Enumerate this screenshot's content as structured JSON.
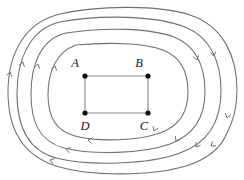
{
  "figure": {
    "kind": "field-line-diagram",
    "background_color": "#ffffff",
    "width": 244,
    "height": 180,
    "colors": {
      "field_line": "#6f6f73",
      "arrow": "#6f6f73",
      "circuit_wire": "#8a8a8f",
      "node_dot": "#111114",
      "label_text": "#16161a"
    }
  },
  "circuit": {
    "shape": "rectangle",
    "vertices": [
      {
        "id": "A",
        "label": "A",
        "x": 85,
        "y": 76,
        "label_x": 79,
        "label_y": 67,
        "label_anchor": "end"
      },
      {
        "id": "B",
        "label": "B",
        "x": 148,
        "y": 76,
        "label_x": 143,
        "label_y": 67,
        "label_anchor": "end"
      },
      {
        "id": "C",
        "label": "C",
        "x": 148,
        "y": 113,
        "label_x": 144,
        "label_y": 130,
        "label_anchor": "middle"
      },
      {
        "id": "D",
        "label": "D",
        "x": 85,
        "y": 113,
        "label_x": 85,
        "label_y": 130,
        "label_anchor": "middle"
      }
    ],
    "edges": [
      {
        "from": "A",
        "to": "B"
      },
      {
        "from": "B",
        "to": "C"
      },
      {
        "from": "C",
        "to": "D"
      },
      {
        "from": "D",
        "to": "A"
      }
    ],
    "node_dot_radius": 2.6
  },
  "field_lines": {
    "count": 4,
    "direction": "counterclockwise",
    "description": "nested closed rounded-rectangular loops encircling the circuit",
    "loops": [
      {
        "id": "loop-1-innermost",
        "closed": false,
        "path": "M 76 45 C 110 42 145 43 163 50 C 181 57 188 72 188 92 C 188 112 180 126 160 133 C 138 141 98 142 75 136 C 55 131 48 116 48 95 C 48 72 56 52 76 45",
        "open_end": {
          "x": 76,
          "y": 45
        }
      },
      {
        "id": "loop-2",
        "closed": true,
        "path": "M 66 33 C 104 27 150 28 174 37 C 196 46 205 66 205 92 C 205 118 194 135 170 144 C 142 154 92 155 64 148 C 38 141 31 120 31 94 C 31 66 40 39 66 33 Z"
      },
      {
        "id": "loop-3",
        "closed": true,
        "path": "M 60 22 C 102 14 157 16 185 27 C 210 37 221 61 221 91 C 221 122 208 143 180 153 C 148 165 88 166 56 158 C 26 150 17 124 17 93 C 17 61 29 29 60 22 Z"
      },
      {
        "id": "loop-4-outermost",
        "closed": false,
        "path": "M 227 133 C 235 118 237 104 237 90 C 237 56 223 26 190 15 C 156 4 96 6 60 14 C 26 22 8 52 8 92 C 8 128 22 155 56 166 C 92 177 152 176 186 166 C 208 159 221 148 227 133",
        "open_end": {
          "x": 227,
          "y": 133
        }
      }
    ],
    "arrows": [
      {
        "on": "loop-1-innermost",
        "x": 55,
        "y": 66,
        "angle": -76,
        "points": "up-left"
      },
      {
        "on": "loop-1-innermost",
        "x": 154,
        "y": 131,
        "angle": 112,
        "points": "down-right"
      },
      {
        "on": "loop-1-innermost",
        "x": 88,
        "y": 140,
        "angle": 190,
        "points": "left"
      },
      {
        "on": "loop-2",
        "x": 38,
        "y": 64,
        "angle": -74,
        "points": "up-left"
      },
      {
        "on": "loop-2",
        "x": 176,
        "y": 141,
        "angle": 117,
        "points": "down-right"
      },
      {
        "on": "loop-2",
        "x": 66,
        "y": 149,
        "angle": 195,
        "points": "left"
      },
      {
        "on": "loop-2",
        "x": 197,
        "y": 60,
        "angle": 75,
        "points": "down-right"
      },
      {
        "on": "loop-3",
        "x": 23,
        "y": 62,
        "angle": -72,
        "points": "up-left"
      },
      {
        "on": "loop-3",
        "x": 196,
        "y": 147,
        "angle": 124,
        "points": "down-right"
      },
      {
        "on": "loop-3",
        "x": 50,
        "y": 160,
        "angle": 198,
        "points": "left"
      },
      {
        "on": "loop-3",
        "x": 214,
        "y": 56,
        "angle": 78,
        "points": "down"
      },
      {
        "on": "loop-4-outermost",
        "x": 227,
        "y": 118,
        "angle": 104,
        "points": "down"
      },
      {
        "on": "loop-4-outermost",
        "x": 211,
        "y": 146,
        "angle": 143,
        "points": "down-left"
      },
      {
        "on": "loop-4-outermost",
        "x": 10,
        "y": 72,
        "angle": -78,
        "points": "up"
      }
    ],
    "arrow_barb_length": 4.6,
    "arrow_barb_spread": 34
  }
}
